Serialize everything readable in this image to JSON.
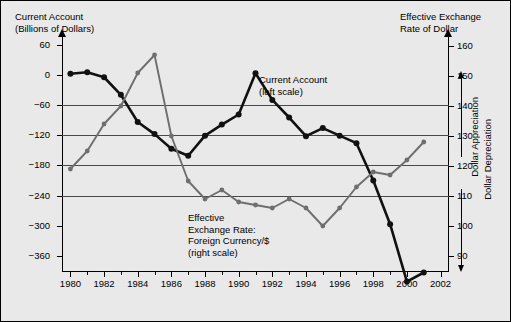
{
  "titles": {
    "left": "Current Account\n(Billions of Dollars)",
    "right": "Effective Exchange\nRate of Dollar"
  },
  "annotations": {
    "current_account": "Current Account\n(left scale)",
    "exchange_rate": "Effective\nExchange Rate:\nForeign Currency/$\n(right scale)"
  },
  "side_labels": {
    "appreciation": "Dollar Appreciation",
    "depreciation": "Dollar Depreciation"
  },
  "colors": {
    "current_account": "#111111",
    "exchange_rate": "#6e6e6e",
    "background": "#e9e9e9",
    "grid": "#4a4a4a"
  },
  "chart_data": {
    "type": "line",
    "title": "",
    "xlabel": "",
    "ylabel": "Current Account (Billions of Dollars)",
    "y2label": "Effective Exchange Rate of Dollar",
    "xlim": [
      1979.5,
      2002.5
    ],
    "ylim": [
      -390,
      75
    ],
    "y2lim": [
      85,
      163
    ],
    "grid": true,
    "legend_position": "inline-annotations",
    "xticks": [
      1980,
      1982,
      1984,
      1986,
      1988,
      1990,
      1992,
      1994,
      1996,
      1998,
      2000,
      2002
    ],
    "xtick_labels": [
      "1980",
      "1982",
      "1984",
      "1986",
      "1988",
      "1990",
      "1992",
      "1994",
      "1996",
      "1998",
      "2000",
      "2002"
    ],
    "xminor": [
      1981,
      1983,
      1985,
      1987,
      1989,
      1991,
      1993,
      1995,
      1997,
      1999,
      2001
    ],
    "yticks": [
      60,
      0,
      -60,
      -120,
      -180,
      -240,
      -300,
      -360
    ],
    "ytick_labels": [
      "60",
      "0",
      "−60",
      "−120",
      "−180",
      "−240",
      "−300",
      "−360"
    ],
    "y2ticks": [
      160,
      150,
      140,
      130,
      120,
      110,
      100,
      90
    ],
    "y2tick_labels": [
      "160",
      "150",
      "140",
      "130",
      "120",
      "110",
      "100",
      "90"
    ],
    "gridlines_left": [
      -60,
      -120,
      -180,
      -240
    ],
    "x": [
      1980,
      1981,
      1982,
      1983,
      1984,
      1985,
      1986,
      1987,
      1988,
      1989,
      1990,
      1991,
      1992,
      1993,
      1994,
      1995,
      1996,
      1997,
      1998,
      1999,
      2000,
      2001
    ],
    "series": [
      {
        "name": "Current Account (left scale)",
        "axis": "left",
        "color": "#111111",
        "values": [
          2,
          5,
          -5,
          -40,
          -94,
          -118,
          -147,
          -161,
          -121,
          -99,
          -79,
          3,
          -50,
          -85,
          -122,
          -106,
          -121,
          -136,
          -210,
          -297,
          -411,
          -393
        ]
      },
      {
        "name": "Effective Exchange Rate: Foreign Currency/$ (right scale)",
        "axis": "right",
        "color": "#6e6e6e",
        "values": [
          119,
          125,
          134,
          140,
          151,
          157,
          130,
          115,
          109,
          112,
          108,
          107,
          106,
          109,
          106,
          100,
          106,
          113,
          118,
          117,
          122,
          128
        ]
      }
    ]
  }
}
